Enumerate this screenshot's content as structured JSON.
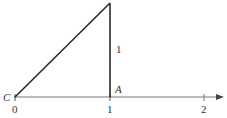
{
  "diagram": {
    "type": "right-triangle-on-number-line",
    "points": {
      "C": {
        "label": "C"
      },
      "A": {
        "label": "A"
      }
    },
    "side_label": "1",
    "number_line": {
      "ticks": [
        "0",
        "1",
        "2"
      ],
      "arrow": "right"
    },
    "colors": {
      "line": "#2a2a2a",
      "axis": "#666666"
    }
  }
}
